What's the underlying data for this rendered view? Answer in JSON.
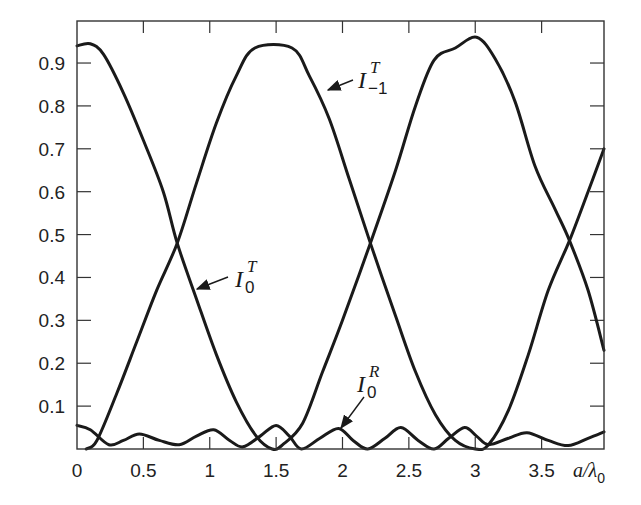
{
  "chart_data": {
    "type": "line",
    "title": "",
    "xlabel": "a/λ0",
    "ylabel": "",
    "xlim": [
      0,
      3.97
    ],
    "ylim": [
      0,
      0.998
    ],
    "x_ticks": [
      0,
      0.5,
      1,
      1.5,
      2,
      2.5,
      3,
      3.5
    ],
    "x_tick_labels": [
      "0",
      "0.5",
      "1",
      "1.5",
      "2",
      "2.5",
      "3",
      "3.5"
    ],
    "y_ticks": [
      0.1,
      0.2,
      0.3,
      0.4,
      0.5,
      0.6,
      0.7,
      0.8,
      0.9
    ],
    "y_tick_labels": [
      "0.1",
      "0.2",
      "0.3",
      "0.4",
      "0.5",
      "0.6",
      "0.7",
      "0.8",
      "0.9"
    ],
    "grid": false,
    "legend": "inline annotations with arrows",
    "series": [
      {
        "name": "I0T",
        "label_main": "I",
        "label_sup": "T",
        "label_sub": "0",
        "points": [
          [
            0,
            0.94
          ],
          [
            0.1,
            0.945
          ],
          [
            0.2,
            0.92
          ],
          [
            0.35,
            0.83
          ],
          [
            0.5,
            0.72
          ],
          [
            0.65,
            0.6
          ],
          [
            0.755,
            0.48
          ],
          [
            0.9,
            0.35
          ],
          [
            1.05,
            0.22
          ],
          [
            1.2,
            0.11
          ],
          [
            1.35,
            0.03
          ],
          [
            1.47,
            0.0
          ],
          [
            1.55,
            0.01
          ],
          [
            1.7,
            0.06
          ],
          [
            1.85,
            0.18
          ],
          [
            2.0,
            0.3
          ],
          [
            2.21,
            0.48
          ],
          [
            2.4,
            0.65
          ],
          [
            2.55,
            0.8
          ],
          [
            2.69,
            0.907
          ],
          [
            2.85,
            0.935
          ],
          [
            3.01,
            0.96
          ],
          [
            3.15,
            0.91
          ],
          [
            3.3,
            0.81
          ],
          [
            3.45,
            0.66
          ],
          [
            3.6,
            0.56
          ],
          [
            3.71,
            0.486
          ],
          [
            3.85,
            0.37
          ],
          [
            3.97,
            0.23
          ]
        ]
      },
      {
        "name": "I-1T",
        "label_main": "I",
        "label_sup": "T",
        "label_sub": "−1",
        "points": [
          [
            0.07,
            0.0
          ],
          [
            0.15,
            0.02
          ],
          [
            0.3,
            0.13
          ],
          [
            0.45,
            0.25
          ],
          [
            0.6,
            0.37
          ],
          [
            0.755,
            0.48
          ],
          [
            0.9,
            0.62
          ],
          [
            1.05,
            0.76
          ],
          [
            1.2,
            0.87
          ],
          [
            1.34,
            0.935
          ],
          [
            1.62,
            0.935
          ],
          [
            1.75,
            0.87
          ],
          [
            1.9,
            0.77
          ],
          [
            2.05,
            0.63
          ],
          [
            2.21,
            0.48
          ],
          [
            2.4,
            0.31
          ],
          [
            2.55,
            0.18
          ],
          [
            2.7,
            0.08
          ],
          [
            2.85,
            0.02
          ],
          [
            3.0,
            0.0
          ],
          [
            3.1,
            0.01
          ],
          [
            3.25,
            0.09
          ],
          [
            3.4,
            0.22
          ],
          [
            3.55,
            0.37
          ],
          [
            3.71,
            0.486
          ],
          [
            3.85,
            0.6
          ],
          [
            3.97,
            0.7
          ]
        ]
      },
      {
        "name": "I0R",
        "label_main": "I",
        "label_sup": "R",
        "label_sub": "0",
        "points": [
          [
            0,
            0.055
          ],
          [
            0.1,
            0.045
          ],
          [
            0.24,
            0.01
          ],
          [
            0.35,
            0.02
          ],
          [
            0.47,
            0.035
          ],
          [
            0.62,
            0.02
          ],
          [
            0.77,
            0.01
          ],
          [
            0.9,
            0.03
          ],
          [
            1.03,
            0.045
          ],
          [
            1.15,
            0.02
          ],
          [
            1.25,
            0.005
          ],
          [
            1.38,
            0.03
          ],
          [
            1.5,
            0.055
          ],
          [
            1.6,
            0.03
          ],
          [
            1.69,
            0.0
          ],
          [
            1.83,
            0.025
          ],
          [
            1.97,
            0.048
          ],
          [
            2.08,
            0.02
          ],
          [
            2.19,
            0.0
          ],
          [
            2.32,
            0.025
          ],
          [
            2.44,
            0.05
          ],
          [
            2.57,
            0.02
          ],
          [
            2.69,
            0.0
          ],
          [
            2.8,
            0.025
          ],
          [
            2.92,
            0.05
          ],
          [
            3.01,
            0.03
          ],
          [
            3.1,
            0.01
          ],
          [
            3.25,
            0.025
          ],
          [
            3.39,
            0.038
          ],
          [
            3.55,
            0.02
          ],
          [
            3.7,
            0.008
          ],
          [
            3.85,
            0.025
          ],
          [
            3.97,
            0.04
          ]
        ]
      }
    ],
    "annotations": [
      {
        "series": "I-1T",
        "text_x": 358,
        "text_y": 88,
        "arrow_from": [
          353,
          80
        ],
        "arrow_to": [
          328,
          90
        ]
      },
      {
        "series": "I0T",
        "text_x": 235,
        "text_y": 287,
        "arrow_from": [
          228,
          277
        ],
        "arrow_to": [
          197,
          289
        ]
      },
      {
        "series": "I0R",
        "text_x": 357,
        "text_y": 392,
        "arrow_from": [
          364,
          397
        ],
        "arrow_to": [
          341,
          428
        ]
      }
    ]
  },
  "plot_box": {
    "left": 77,
    "top": 21,
    "right": 604,
    "bottom": 449
  },
  "axis_label": {
    "x_main": "a/λ",
    "x_sub": "0"
  }
}
